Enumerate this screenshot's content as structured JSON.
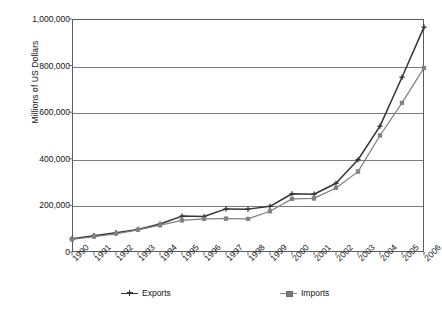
{
  "chart_data": {
    "type": "line",
    "title": "",
    "xlabel": "",
    "ylabel": "Millions of US Dollars",
    "ylim": [
      0,
      1000000
    ],
    "ytick_labels": [
      "1,000,000",
      "800,000",
      "600,000",
      "400,000",
      "200,000",
      "0"
    ],
    "ytick_values": [
      1000000,
      800000,
      600000,
      400000,
      200000,
      0
    ],
    "grid": true,
    "legend_position": "bottom",
    "categories": [
      "1990",
      "1991",
      "1992",
      "1993",
      "1994",
      "1995",
      "1996",
      "1997",
      "1998",
      "1999",
      "2000",
      "2001",
      "2002",
      "2003",
      "2004",
      "2005",
      "2006"
    ],
    "series": [
      {
        "name": "Exports",
        "color": "#333333",
        "marker": "cross",
        "values": [
          57000,
          70000,
          83000,
          97000,
          120000,
          154000,
          152000,
          185000,
          184000,
          196000,
          250000,
          248000,
          295000,
          396000,
          540000,
          750000,
          965000
        ]
      },
      {
        "name": "Imports",
        "color": "#808080",
        "marker": "square",
        "values": [
          54000,
          66000,
          78000,
          95000,
          115000,
          136000,
          142000,
          143000,
          142000,
          175000,
          228000,
          230000,
          275000,
          345000,
          500000,
          640000,
          790000
        ]
      }
    ]
  },
  "legend": {
    "entries": [
      {
        "label": "Exports"
      },
      {
        "label": "Imports"
      }
    ]
  },
  "colors": {
    "exports": "#333333",
    "imports": "#808080",
    "axis": "#5c5c5c",
    "grid": "#7a7a7a",
    "text": "#141414",
    "background": "#ffffff"
  }
}
